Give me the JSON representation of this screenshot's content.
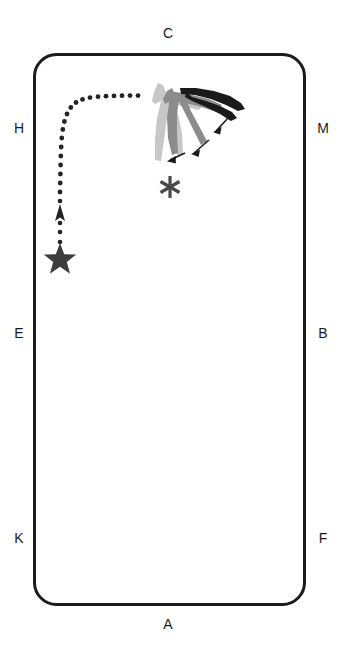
{
  "diagram": {
    "arena": {
      "shape": "rounded-rectangle",
      "border_color": "#1c1c1c",
      "border_width_px": 3,
      "fill": "#ffffff",
      "corner_radius_px": 22,
      "x": 33,
      "y": 53,
      "width": 272,
      "height": 552
    },
    "markers": [
      {
        "id": "C",
        "label": "C",
        "side": "top",
        "x": 168,
        "y": 33
      },
      {
        "id": "H",
        "label": "H",
        "side": "left",
        "x": 16,
        "y": 128
      },
      {
        "id": "M",
        "label": "M",
        "side": "right",
        "x": 322,
        "y": 128
      },
      {
        "id": "E",
        "label": "E",
        "side": "left",
        "x": 16,
        "y": 333
      },
      {
        "id": "B",
        "label": "B",
        "side": "right",
        "x": 322,
        "y": 333
      },
      {
        "id": "K",
        "label": "K",
        "side": "left",
        "x": 16,
        "y": 538
      },
      {
        "id": "F",
        "label": "F",
        "side": "right",
        "x": 322,
        "y": 538
      },
      {
        "id": "A",
        "label": "A",
        "side": "bottom",
        "x": 168,
        "y": 624
      }
    ],
    "start_marker": {
      "name": "star",
      "glyph": "star",
      "color": "#3d3d3d",
      "x": 60,
      "y": 257,
      "size_px": 28
    },
    "point_marker": {
      "name": "asterisk",
      "glyph": "asterisk",
      "color": "#4a4a4a",
      "x": 170,
      "y": 187,
      "size_px": 26
    },
    "path": {
      "name": "movement-track",
      "style": "dotted",
      "dot_color": "#232323",
      "dot_radius_px": 2.4,
      "direction_arrow": {
        "x": 60,
        "y": 213,
        "points": "up"
      },
      "description": "Vertical line up from the star, curving right at the top and running horizontally toward the horse."
    },
    "horse": {
      "name": "horse-figure",
      "description": "Stacked multi-tone horse silhouettes showing a motion sequence, with three motion arrows at the legs.",
      "tones": {
        "light": "#c9c9c9",
        "mid": "#8e8e8e",
        "dark": "#1a1a1a"
      },
      "arrow_color": "#1a1a1a",
      "x": 148,
      "y": 78,
      "width": 98,
      "height": 92
    }
  }
}
